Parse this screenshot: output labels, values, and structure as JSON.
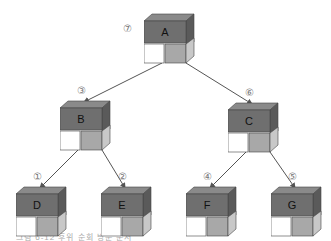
{
  "diagram": {
    "type": "binary-tree-postorder",
    "colors": {
      "box_front": "#6f6f6f",
      "box_top": "#8a8a8a",
      "box_side": "#5a5a5a",
      "left_cell": "#ffffff",
      "right_cell": "#a8a8a8",
      "right_cell_side": "#c8c8c8",
      "outline": "#444444",
      "arrow": "#555555",
      "order_label": "#888888"
    },
    "nodes": [
      {
        "id": "A",
        "label": "A",
        "order": "⑦",
        "x": 144,
        "y": 13
      },
      {
        "id": "B",
        "label": "B",
        "order": "③",
        "x": 60,
        "y": 100
      },
      {
        "id": "C",
        "label": "C",
        "order": "⑥",
        "x": 228,
        "y": 102
      },
      {
        "id": "D",
        "label": "D",
        "order": "①",
        "x": 16,
        "y": 186
      },
      {
        "id": "E",
        "label": "E",
        "order": "②",
        "x": 101,
        "y": 186
      },
      {
        "id": "F",
        "label": "F",
        "order": "④",
        "x": 186,
        "y": 186
      },
      {
        "id": "G",
        "label": "G",
        "order": "⑤",
        "x": 271,
        "y": 186
      }
    ],
    "edges": [
      [
        "A",
        "B"
      ],
      [
        "A",
        "C"
      ],
      [
        "B",
        "D"
      ],
      [
        "B",
        "E"
      ],
      [
        "C",
        "F"
      ],
      [
        "C",
        "G"
      ]
    ],
    "caption": "그림 6-12 후위 순회 방문 순서"
  }
}
